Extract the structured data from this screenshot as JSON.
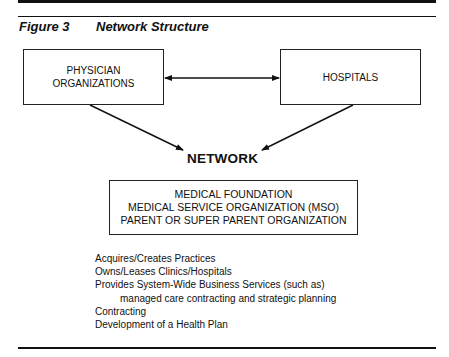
{
  "figure": {
    "number": "Figure 3",
    "title": "Network Structure"
  },
  "nodes": {
    "physician_organizations": {
      "line1": "PHYSICIAN",
      "line2": "ORGANIZATIONS"
    },
    "hospitals": {
      "label": "HOSPITALS"
    },
    "network": {
      "label": "NETWORK"
    },
    "organization_box": {
      "line1": "MEDICAL FOUNDATION",
      "line2": "MEDICAL SERVICE ORGANIZATION (MSO)",
      "line3": "PARENT OR SUPER PARENT ORGANIZATION"
    }
  },
  "edges": [
    {
      "from": "PHYSICIAN ORGANIZATIONS",
      "to": "HOSPITALS",
      "type": "bidirectional"
    },
    {
      "from": "PHYSICIAN ORGANIZATIONS",
      "to": "NETWORK",
      "type": "directed"
    },
    {
      "from": "HOSPITALS",
      "to": "NETWORK",
      "type": "directed"
    }
  ],
  "functions": [
    "Acquires/Creates Practices",
    "Owns/Leases Clinics/Hospitals",
    "Provides System-Wide Business Services (such as)",
    "managed care contracting and strategic planning",
    "Contracting",
    "Development of a Health Plan"
  ],
  "colors": {
    "ink": "#111111",
    "background": "#ffffff"
  }
}
